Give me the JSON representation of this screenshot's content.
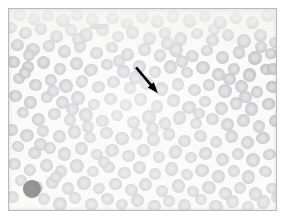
{
  "figure": {
    "title": "Peripheral blood smear micrograph",
    "caption": "",
    "width": 284,
    "height": 220,
    "frame": {
      "x": 8,
      "y": 8,
      "width": 269,
      "height": 203,
      "border_color": "#b9b9bc"
    },
    "background_color": "#ffffff",
    "field_background_color": "#fbfbfa"
  },
  "palette": {
    "background": "#ffffff",
    "slide_background": "#fbfbfa",
    "rbc_fill": "#a9a9ae",
    "rbc_fill_light": "#bdbdc2",
    "rbc_fill_dark": "#96969c",
    "rbc_center_pallor": "#cfcfd4",
    "rbc_rim": "#8f8f96",
    "dark_cell": "#111113",
    "annotation": "#000000",
    "frame_border": "#b9b9bc"
  },
  "annotations": [
    {
      "name": "pointer-arrow",
      "type": "arrow",
      "color": "#000000",
      "x1": 128,
      "y1": 59,
      "x2": 150,
      "y2": 85,
      "head_length": 11,
      "head_width": 8,
      "shaft_width": 2.6
    }
  ],
  "features": {
    "dark_cell": {
      "cx": 23,
      "cy": 180,
      "r": 9.0,
      "label": "darkly-stained-cell"
    },
    "elongated_cell": {
      "cx": 90,
      "cy": 18,
      "rx": 10,
      "ry": 2.6,
      "angle": -8,
      "label": "elongated-cell"
    },
    "cell_count_rendered": 268,
    "mean_cell_radius": 6.9
  },
  "cells": [
    [
      11,
      6,
      6.6,
      0.9,
      -14
    ],
    [
      25,
      10,
      6.2,
      0.94,
      6
    ],
    [
      39,
      7,
      5.9,
      0.88,
      22
    ],
    [
      54,
      12,
      6.8,
      0.96,
      -4
    ],
    [
      68,
      6,
      6.1,
      0.92,
      17
    ],
    [
      83,
      11,
      6.4,
      0.91,
      -21
    ],
    [
      104,
      9,
      6.6,
      0.95,
      8
    ],
    [
      118,
      15,
      6.0,
      0.89,
      -11
    ],
    [
      133,
      8,
      6.3,
      0.93,
      30
    ],
    [
      149,
      13,
      6.7,
      0.97,
      -6
    ],
    [
      164,
      7,
      6.1,
      0.9,
      14
    ],
    [
      180,
      12,
      6.5,
      0.94,
      -19
    ],
    [
      196,
      8,
      6.2,
      0.92,
      3
    ],
    [
      211,
      14,
      6.9,
      0.96,
      25
    ],
    [
      227,
      9,
      6.0,
      0.88,
      -9
    ],
    [
      243,
      13,
      6.4,
      0.93,
      11
    ],
    [
      258,
      7,
      6.3,
      0.91,
      -24
    ],
    [
      2,
      18,
      6.1,
      0.87,
      5
    ],
    [
      17,
      24,
      6.7,
      0.95,
      -16
    ],
    [
      32,
      20,
      6.2,
      0.9,
      20
    ],
    [
      47,
      27,
      6.5,
      0.93,
      -3
    ],
    [
      62,
      21,
      6.0,
      0.89,
      13
    ],
    [
      77,
      26,
      6.8,
      0.97,
      -22
    ],
    [
      93,
      22,
      6.3,
      0.92,
      7
    ],
    [
      109,
      28,
      6.1,
      0.88,
      18
    ],
    [
      124,
      23,
      6.6,
      0.94,
      -12
    ],
    [
      140,
      29,
      6.4,
      0.91,
      26
    ],
    [
      156,
      24,
      6.0,
      0.9,
      -5
    ],
    [
      172,
      30,
      6.7,
      0.96,
      9
    ],
    [
      188,
      25,
      6.2,
      0.89,
      -18
    ],
    [
      203,
      31,
      6.5,
      0.93,
      15
    ],
    [
      219,
      26,
      6.1,
      0.91,
      -8
    ],
    [
      235,
      32,
      6.8,
      0.95,
      21
    ],
    [
      251,
      27,
      6.3,
      0.92,
      -2
    ],
    [
      266,
      33,
      6.0,
      0.88,
      12
    ],
    [
      8,
      36,
      6.4,
      0.93,
      -20
    ],
    [
      24,
      41,
      6.9,
      0.97,
      4
    ],
    [
      40,
      37,
      6.1,
      0.89,
      17
    ],
    [
      56,
      43,
      6.6,
      0.94,
      -13
    ],
    [
      71,
      38,
      6.2,
      0.91,
      28
    ],
    [
      87,
      44,
      6.5,
      0.93,
      -6
    ],
    [
      103,
      39,
      6.0,
      0.88,
      10
    ],
    [
      119,
      45,
      6.7,
      0.96,
      -23
    ],
    [
      135,
      40,
      6.3,
      0.92,
      2
    ],
    [
      151,
      46,
      6.1,
      0.9,
      19
    ],
    [
      167,
      41,
      6.8,
      0.95,
      -10
    ],
    [
      183,
      47,
      6.4,
      0.93,
      24
    ],
    [
      198,
      42,
      6.0,
      0.89,
      -4
    ],
    [
      214,
      48,
      6.6,
      0.94,
      14
    ],
    [
      230,
      43,
      6.2,
      0.91,
      -17
    ],
    [
      246,
      49,
      6.9,
      0.97,
      8
    ],
    [
      262,
      44,
      6.1,
      0.88,
      -25
    ],
    [
      4,
      53,
      6.5,
      0.93,
      6
    ],
    [
      19,
      58,
      6.2,
      0.9,
      -11
    ],
    [
      35,
      54,
      6.7,
      0.96,
      22
    ],
    [
      51,
      60,
      6.0,
      0.89,
      -3
    ],
    [
      67,
      55,
      6.4,
      0.93,
      16
    ],
    [
      82,
      61,
      6.8,
      0.95,
      -20
    ],
    [
      98,
      56,
      6.1,
      0.91,
      9
    ],
    [
      114,
      62,
      6.5,
      0.94,
      -7
    ],
    [
      130,
      57,
      6.3,
      0.92,
      27
    ],
    [
      146,
      63,
      6.0,
      0.88,
      -14
    ],
    [
      162,
      58,
      6.6,
      0.95,
      5
    ],
    [
      178,
      64,
      6.2,
      0.9,
      18
    ],
    [
      194,
      59,
      6.9,
      0.97,
      -9
    ],
    [
      209,
      65,
      6.4,
      0.93,
      12
    ],
    [
      225,
      60,
      6.1,
      0.89,
      -21
    ],
    [
      241,
      66,
      6.7,
      0.96,
      3
    ],
    [
      257,
      61,
      6.3,
      0.92,
      20
    ],
    [
      10,
      70,
      6.0,
      0.88,
      -6
    ],
    [
      26,
      76,
      6.5,
      0.94,
      15
    ],
    [
      42,
      71,
      6.2,
      0.91,
      -18
    ],
    [
      57,
      77,
      6.8,
      0.96,
      7
    ],
    [
      73,
      72,
      6.1,
      0.89,
      24
    ],
    [
      89,
      78,
      6.4,
      0.93,
      -12
    ],
    [
      105,
      73,
      6.6,
      0.95,
      1
    ],
    [
      121,
      79,
      6.0,
      0.9,
      19
    ],
    [
      137,
      74,
      6.3,
      0.92,
      -23
    ],
    [
      153,
      80,
      6.7,
      0.96,
      10
    ],
    [
      169,
      75,
      6.1,
      0.88,
      -5
    ],
    [
      185,
      81,
      6.5,
      0.94,
      21
    ],
    [
      200,
      76,
      6.2,
      0.91,
      -15
    ],
    [
      216,
      82,
      6.9,
      0.97,
      4
    ],
    [
      232,
      77,
      6.4,
      0.93,
      17
    ],
    [
      248,
      83,
      6.0,
      0.89,
      -8
    ],
    [
      264,
      78,
      6.6,
      0.95,
      26
    ],
    [
      6,
      87,
      6.3,
      0.92,
      -2
    ],
    [
      22,
      93,
      6.7,
      0.96,
      13
    ],
    [
      38,
      88,
      6.1,
      0.89,
      -20
    ],
    [
      53,
      94,
      6.4,
      0.93,
      6
    ],
    [
      69,
      89,
      6.8,
      0.96,
      22
    ],
    [
      85,
      95,
      6.0,
      0.88,
      -11
    ],
    [
      101,
      90,
      6.5,
      0.94,
      8
    ],
    [
      117,
      96,
      6.2,
      0.91,
      -24
    ],
    [
      132,
      91,
      6.6,
      0.95,
      16
    ],
    [
      148,
      97,
      6.1,
      0.9,
      -4
    ],
    [
      164,
      92,
      6.3,
      0.92,
      19
    ],
    [
      180,
      98,
      6.9,
      0.97,
      -13
    ],
    [
      196,
      93,
      6.0,
      0.89,
      2
    ],
    [
      212,
      99,
      6.5,
      0.94,
      25
    ],
    [
      227,
      94,
      6.2,
      0.91,
      -9
    ],
    [
      243,
      100,
      6.7,
      0.96,
      11
    ],
    [
      259,
      95,
      6.4,
      0.93,
      -18
    ],
    [
      14,
      104,
      6.1,
      0.88,
      5
    ],
    [
      30,
      110,
      6.6,
      0.95,
      20
    ],
    [
      45,
      105,
      6.3,
      0.92,
      -7
    ],
    [
      61,
      111,
      6.0,
      0.89,
      14
    ],
    [
      77,
      106,
      6.8,
      0.96,
      -22
    ],
    [
      93,
      112,
      6.4,
      0.93,
      3
    ],
    [
      108,
      107,
      6.1,
      0.9,
      18
    ],
    [
      124,
      113,
      6.5,
      0.94,
      -12
    ],
    [
      140,
      108,
      6.9,
      0.97,
      9
    ],
    [
      156,
      114,
      6.2,
      0.91,
      -19
    ],
    [
      171,
      109,
      6.6,
      0.95,
      23
    ],
    [
      187,
      115,
      6.0,
      0.88,
      -3
    ],
    [
      203,
      110,
      6.3,
      0.92,
      12
    ],
    [
      219,
      116,
      6.7,
      0.96,
      -16
    ],
    [
      234,
      111,
      6.4,
      0.93,
      7
    ],
    [
      250,
      117,
      6.1,
      0.89,
      21
    ],
    [
      266,
      112,
      6.5,
      0.94,
      -10
    ],
    [
      3,
      121,
      6.2,
      0.91,
      17
    ],
    [
      18,
      127,
      6.8,
      0.96,
      -5
    ],
    [
      34,
      122,
      6.0,
      0.88,
      24
    ],
    [
      50,
      128,
      6.4,
      0.93,
      -14
    ],
    [
      66,
      123,
      6.6,
      0.95,
      1
    ],
    [
      81,
      129,
      6.1,
      0.9,
      19
    ],
    [
      97,
      124,
      6.3,
      0.92,
      -21
    ],
    [
      113,
      130,
      6.9,
      0.97,
      8
    ],
    [
      128,
      125,
      6.0,
      0.89,
      15
    ],
    [
      144,
      131,
      6.5,
      0.94,
      -8
    ],
    [
      160,
      126,
      6.2,
      0.91,
      26
    ],
    [
      176,
      132,
      6.7,
      0.96,
      -2
    ],
    [
      191,
      127,
      6.4,
      0.93,
      13
    ],
    [
      207,
      133,
      6.1,
      0.88,
      -17
    ],
    [
      223,
      128,
      6.6,
      0.95,
      6
    ],
    [
      238,
      134,
      6.3,
      0.92,
      22
    ],
    [
      254,
      129,
      6.8,
      0.96,
      -11
    ],
    [
      9,
      138,
      6.0,
      0.89,
      4
    ],
    [
      25,
      144,
      6.5,
      0.94,
      18
    ],
    [
      41,
      139,
      6.2,
      0.91,
      -23
    ],
    [
      56,
      145,
      6.7,
      0.96,
      10
    ],
    [
      72,
      140,
      6.4,
      0.93,
      -6
    ],
    [
      88,
      146,
      6.1,
      0.9,
      20
    ],
    [
      103,
      141,
      6.9,
      0.97,
      -13
    ],
    [
      119,
      147,
      6.3,
      0.92,
      3
    ],
    [
      135,
      142,
      6.6,
      0.95,
      16
    ],
    [
      150,
      148,
      6.0,
      0.88,
      -9
    ],
    [
      166,
      143,
      6.4,
      0.93,
      25
    ],
    [
      182,
      149,
      6.2,
      0.91,
      -4
    ],
    [
      197,
      144,
      6.7,
      0.96,
      12
    ],
    [
      213,
      150,
      6.5,
      0.94,
      -20
    ],
    [
      229,
      145,
      6.1,
      0.89,
      7
    ],
    [
      244,
      151,
      6.8,
      0.96,
      19
    ],
    [
      260,
      146,
      6.3,
      0.92,
      -15
    ],
    [
      6,
      155,
      6.6,
      0.95,
      2
    ],
    [
      21,
      161,
      6.0,
      0.89,
      23
    ],
    [
      37,
      156,
      6.4,
      0.93,
      -10
    ],
    [
      52,
      162,
      6.2,
      0.91,
      14
    ],
    [
      68,
      157,
      6.9,
      0.97,
      -21
    ],
    [
      84,
      163,
      6.1,
      0.88,
      5
    ],
    [
      99,
      158,
      6.5,
      0.94,
      17
    ],
    [
      115,
      164,
      6.3,
      0.92,
      -7
    ],
    [
      131,
      159,
      6.7,
      0.96,
      21
    ],
    [
      146,
      165,
      6.0,
      0.9,
      -16
    ],
    [
      162,
      160,
      6.4,
      0.93,
      9
    ],
    [
      178,
      166,
      6.2,
      0.91,
      24
    ],
    [
      193,
      161,
      6.8,
      0.96,
      -3
    ],
    [
      209,
      167,
      6.5,
      0.94,
      11
    ],
    [
      225,
      162,
      6.1,
      0.89,
      -18
    ],
    [
      240,
      168,
      6.6,
      0.95,
      6
    ],
    [
      256,
      163,
      6.3,
      0.92,
      20
    ],
    [
      12,
      172,
      6.0,
      0.88,
      -12
    ],
    [
      28,
      178,
      6.7,
      0.96,
      8
    ],
    [
      43,
      173,
      6.4,
      0.93,
      22
    ],
    [
      59,
      179,
      6.2,
      0.91,
      -5
    ],
    [
      75,
      174,
      6.9,
      0.97,
      15
    ],
    [
      90,
      180,
      6.1,
      0.9,
      -22
    ],
    [
      106,
      175,
      6.5,
      0.94,
      4
    ],
    [
      122,
      181,
      6.3,
      0.92,
      18
    ],
    [
      137,
      176,
      6.6,
      0.95,
      -9
    ],
    [
      153,
      182,
      6.0,
      0.89,
      26
    ],
    [
      169,
      177,
      6.4,
      0.93,
      -14
    ],
    [
      184,
      183,
      6.2,
      0.91,
      7
    ],
    [
      200,
      178,
      6.8,
      0.96,
      20
    ],
    [
      216,
      184,
      6.5,
      0.94,
      -2
    ],
    [
      231,
      179,
      6.1,
      0.88,
      13
    ],
    [
      247,
      185,
      6.7,
      0.96,
      -19
    ],
    [
      263,
      180,
      6.3,
      0.92,
      5
    ],
    [
      4,
      188,
      6.6,
      0.95,
      16
    ],
    [
      35,
      190,
      6.2,
      0.91,
      -8
    ],
    [
      51,
      195,
      6.9,
      0.97,
      23
    ],
    [
      66,
      189,
      6.0,
      0.89,
      -11
    ],
    [
      82,
      196,
      6.4,
      0.93,
      3
    ],
    [
      98,
      190,
      6.5,
      0.94,
      19
    ],
    [
      113,
      196,
      6.1,
      0.9,
      -24
    ],
    [
      129,
      191,
      6.7,
      0.96,
      10
    ],
    [
      145,
      197,
      6.3,
      0.92,
      -6
    ],
    [
      160,
      192,
      6.0,
      0.88,
      21
    ],
    [
      176,
      197,
      6.6,
      0.95,
      -15
    ],
    [
      192,
      191,
      6.2,
      0.91,
      8
    ],
    [
      207,
      197,
      6.8,
      0.96,
      12
    ],
    [
      223,
      192,
      6.4,
      0.93,
      -20
    ],
    [
      239,
      198,
      6.1,
      0.89,
      2
    ],
    [
      254,
      193,
      6.5,
      0.94,
      17
    ],
    [
      268,
      188,
      6.0,
      0.88,
      -10
    ],
    [
      16,
      64,
      6.2,
      0.9,
      11
    ],
    [
      44,
      82,
      6.0,
      0.88,
      -7
    ],
    [
      63,
      100,
      6.3,
      0.92,
      14
    ],
    [
      110,
      52,
      6.1,
      0.89,
      -16
    ],
    [
      158,
      35,
      6.4,
      0.93,
      5
    ],
    [
      205,
      20,
      6.0,
      0.88,
      22
    ],
    [
      252,
      38,
      6.2,
      0.91,
      -13
    ],
    [
      31,
      135,
      6.5,
      0.94,
      9
    ],
    [
      79,
      118,
      6.1,
      0.9,
      -4
    ],
    [
      126,
      68,
      6.3,
      0.92,
      18
    ],
    [
      173,
      52,
      6.0,
      0.89,
      -21
    ],
    [
      220,
      70,
      6.4,
      0.93,
      6
    ],
    [
      264,
      60,
      6.1,
      0.88,
      15
    ],
    [
      47,
      168,
      6.2,
      0.91,
      -12
    ],
    [
      95,
      153,
      6.0,
      0.9,
      7
    ],
    [
      143,
      120,
      6.3,
      0.92,
      20
    ],
    [
      190,
      104,
      6.1,
      0.89,
      -5
    ],
    [
      236,
      88,
      6.4,
      0.93,
      13
    ],
    [
      20,
      46,
      6.0,
      0.88,
      -18
    ],
    [
      69,
      30,
      6.2,
      0.91,
      4
    ]
  ]
}
